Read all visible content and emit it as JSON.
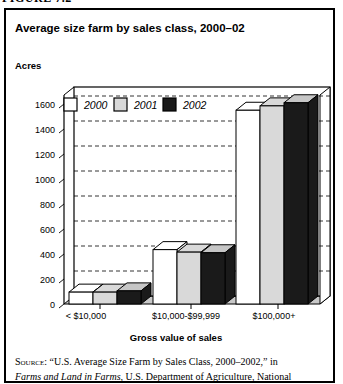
{
  "figure_label": "FIGURE 7.2",
  "chart_data": {
    "type": "bar",
    "style": "3d-grouped",
    "title": "Average size farm by sales class, 2000–02",
    "ylabel": "Acres",
    "xlabel": "Gross value of sales",
    "categories": [
      "< $10,000",
      "$10,000-$99,999",
      "$100,000+"
    ],
    "series": [
      {
        "name": "2000",
        "values": [
          95,
          435,
          1550
        ],
        "color": "#ffffff",
        "top_color": "#ffffff",
        "side_color": "#e2e2e2"
      },
      {
        "name": "2001",
        "values": [
          95,
          415,
          1585
        ],
        "color": "#d9d9d9",
        "top_color": "#d9d9d9",
        "side_color": "#bfbfbf"
      },
      {
        "name": "2002",
        "values": [
          105,
          410,
          1610
        ],
        "color": "#1a1a1a",
        "top_color": "#c6c6c6",
        "side_color": "#1a1a1a"
      }
    ],
    "ylim": [
      0,
      1600
    ],
    "ytick_step": 200,
    "grid": "dashed-horizontal",
    "legend_position": "top-inside",
    "floor_color": "#c8c8c8"
  },
  "source": {
    "label": "Source:",
    "line1": "“U.S. Average Size Farm by Sales Class, 2000–2002,” in",
    "line2_italic": "Farms and Land in Farms,",
    "line2_rest": " U.S. Department of Agriculture, National"
  }
}
